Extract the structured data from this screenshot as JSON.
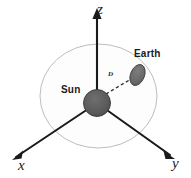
{
  "figure": {
    "background_color": "#ffffff"
  },
  "axes": {
    "z": {
      "label": "z",
      "direction": "up",
      "arrow": true
    },
    "x": {
      "label": "x",
      "direction": "down-left",
      "arrow": true
    },
    "y": {
      "label": "y",
      "direction": "down-right",
      "arrow": true
    },
    "line_color": "#1a1a1a",
    "origin_label": "Sun"
  },
  "bodies": {
    "sun": {
      "label": "Sun",
      "shape": "circle",
      "fill_color": "#595959",
      "stroke_color": "#333333"
    },
    "earth": {
      "label": "Earth",
      "shape": "ellipse",
      "fill_color": "#6b6b6b",
      "stroke_color": "#3d3d3d"
    }
  },
  "orbit": {
    "name": "orbit-sphere",
    "shape": "ellipse",
    "stroke_color": "#b3b3b3",
    "fill_color": "#fcfcfc"
  },
  "distance": {
    "label": "D",
    "line_style": "dashed",
    "line_color": "#2b2b2b",
    "from": "Sun",
    "to": "Earth"
  }
}
